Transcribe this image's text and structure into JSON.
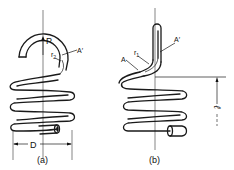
{
  "figure": {
    "subfigures": [
      {
        "caption": "(a)",
        "labels": {
          "force": "P",
          "radius": "r",
          "radius_sub": "2",
          "point": "A′",
          "diameter": "D"
        }
      },
      {
        "caption": "(b)",
        "labels": {
          "point_a": "A",
          "point_a_prime": "A′",
          "radius": "r",
          "radius_sub": "1",
          "length": "ℓ"
        }
      }
    ]
  }
}
